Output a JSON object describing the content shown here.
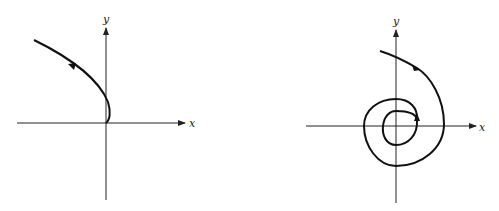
{
  "figure": {
    "panels": [
      {
        "id": "left",
        "description": "Trajectory leaving the origin, curving right then up-left",
        "x_axis_label": "x",
        "y_axis_label": "y"
      },
      {
        "id": "right",
        "description": "Spiral trajectory winding outward from near origin",
        "x_axis_label": "x",
        "y_axis_label": "y"
      }
    ]
  },
  "colors": {
    "stroke": "#111111",
    "axis": "#222222",
    "background": "#ffffff"
  }
}
